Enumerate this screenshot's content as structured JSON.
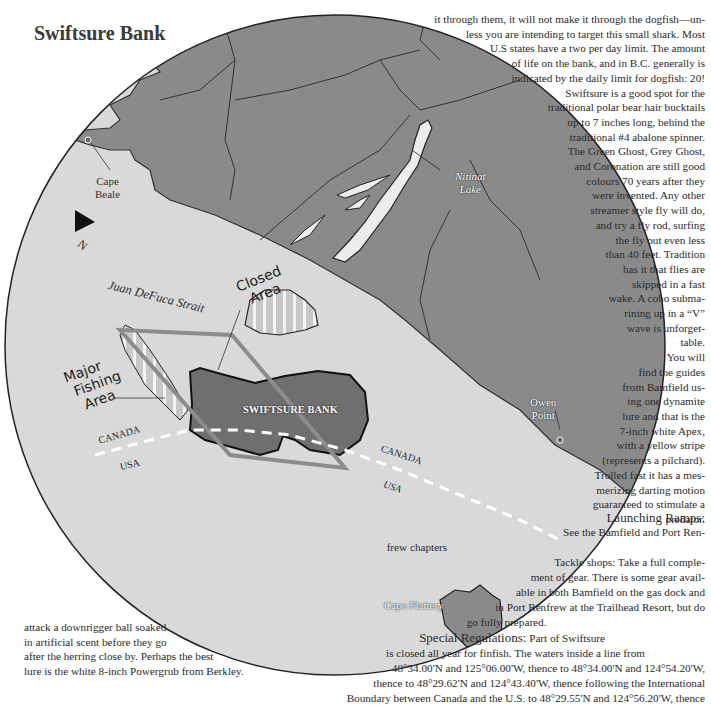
{
  "page": {
    "title": "Swiftsure Bank"
  },
  "map": {
    "labels": {
      "cape_beale": [
        "Cape",
        "Beale"
      ],
      "north": "N",
      "nitinat_lake": [
        "Nitinat",
        "Lake"
      ],
      "juan_defuca": "Juan DeFuca Strait",
      "closed_area": [
        "Closed",
        "Area"
      ],
      "major_fishing_area": [
        "Major",
        "Fishing",
        "Area"
      ],
      "swiftsure_bank": "SWIFTSURE BANK",
      "canada_left": "CANADA",
      "usa_left": "USA",
      "canada_right": "CANADA",
      "usa_right": "USA",
      "owen_point": [
        "Owen",
        "Point"
      ],
      "cape_flattery": "Cape Flattery"
    },
    "colors": {
      "land": "#8a8a8a",
      "water": "#d9d9d9",
      "bank": "#6f6f6f",
      "boundary": "#ffffff"
    }
  },
  "text_right": {
    "lines": [
      "it through them, it will not make it through the dogfish—un-",
      "less you are intending to target this small shark. Most",
      "U.S states have a two per day limit. The amount",
      "of life on the bank, and in B.C. generally is",
      "indicated by the daily limit for dogfish: 20!",
      "Swiftsure is a good spot for the",
      "traditional polar bear hair bucktails",
      "up to 7 inches long, behind the",
      "traditional #4 abalone spinner.",
      "The Green Ghost, Grey Ghost,",
      "and Coronation are still good",
      "colours 70 years after they",
      "were invented. Any other",
      "streamer style fly will do,",
      "and try a fly rod, surfing",
      "the fly out even less",
      "than 40 feet. Tradition",
      "has it that flies are",
      "skipped in a fast",
      "wake. A coho subma-",
      "rining up in a “V”",
      "wave is unforget-",
      "table.",
      "You will",
      "find the guides",
      "from Bamfield us-",
      "ing one dynamite",
      "lure and that is the",
      "7-inch white Apex,",
      "with a yellow stripe",
      "(represents a pilchard).",
      "Trolled fast it has a mes-",
      "merizing darting motion",
      "guaranteed to stimulate a",
      "predator."
    ]
  },
  "sidebar": {
    "launching_heading": "Launching Ramps:",
    "launching_lines": [
      "See the Bamfield and Port Ren-",
      "frew chapters"
    ],
    "tackle_lines": [
      "Tackle shops: Take a full comple-",
      "ment of gear. There is some gear avail-",
      "able in both Bamfield on the gas dock and",
      "in Port Renfrew at the Trailhead Resort, but do",
      "go fully prepared."
    ],
    "regs_heading": "Special Regulations:",
    "regs_lines": [
      "Part of Swiftsure",
      "is closed all year for finfish. The waters inside a line from",
      "48°34.00'N and 125°06.00'W, thence to 48°34.00'N and 124°54.20'W,",
      "thence to 48°29.62'N and 124°43.40'W, thence following the International",
      "Boundary between Canada and the U.S. to 48°29.55'N and 124°56.20'W, thence"
    ]
  },
  "text_left": {
    "lines": [
      "attack a downrigger ball soaked",
      "in artificial scent before they go",
      "after the herring close by. Perhaps the best",
      "lure is the white 8-inch Powergrub from Berkley."
    ]
  }
}
